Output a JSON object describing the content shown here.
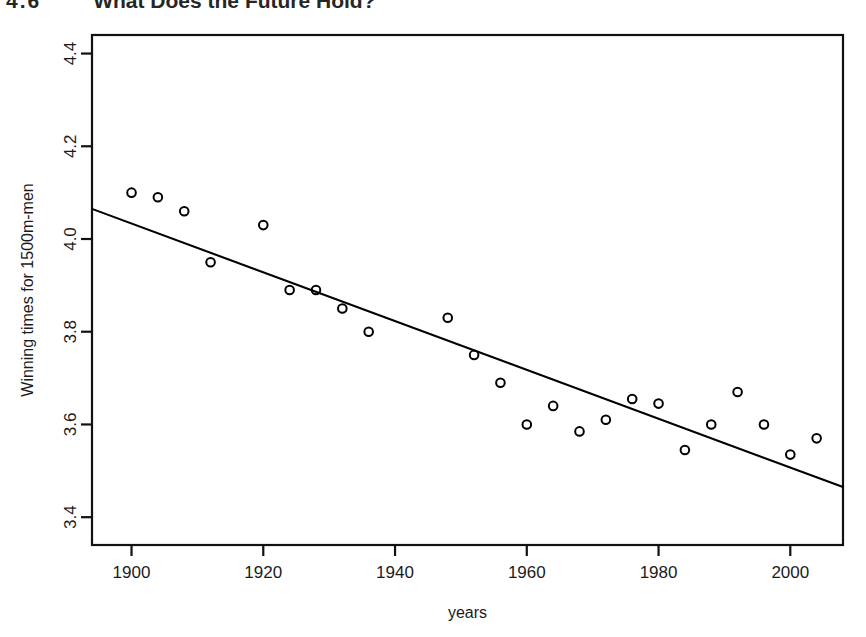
{
  "slide": {
    "number": "4.6",
    "title": "What Does the Future Hold?"
  },
  "chart_data": {
    "type": "scatter",
    "title": "",
    "xlabel": "years",
    "ylabel": "Winning times for 1500m-men",
    "xlim": [
      1894,
      2008
    ],
    "ylim": [
      3.34,
      4.44
    ],
    "xticks": [
      1900,
      1920,
      1940,
      1960,
      1980,
      2000
    ],
    "xtick_labels": [
      "1900",
      "1920",
      "1940",
      "1960",
      "1980",
      "2000"
    ],
    "yticks": [
      3.4,
      3.6,
      3.8,
      4.0,
      4.2,
      4.4
    ],
    "ytick_labels": [
      "3.4",
      "3.6",
      "3.8",
      "4.0",
      "4.2",
      "4.4"
    ],
    "grid": false,
    "legend": null,
    "marker": "open-circle",
    "marker_color": "#000000",
    "line_color": "#000000",
    "x": [
      1900,
      1904,
      1908,
      1912,
      1920,
      1924,
      1928,
      1932,
      1936,
      1948,
      1952,
      1956,
      1960,
      1964,
      1968,
      1972,
      1976,
      1980,
      1984,
      1988,
      1992,
      1996,
      2000,
      2004
    ],
    "y": [
      4.1,
      4.09,
      4.06,
      3.95,
      4.03,
      3.89,
      3.89,
      3.85,
      3.8,
      3.83,
      3.75,
      3.69,
      3.6,
      3.64,
      3.585,
      3.61,
      3.655,
      3.645,
      3.545,
      3.6,
      3.67,
      3.6,
      3.535,
      3.57
    ],
    "series": [
      {
        "name": "Winning times",
        "type": "scatter",
        "x": [
          1900,
          1904,
          1908,
          1912,
          1920,
          1924,
          1928,
          1932,
          1936,
          1948,
          1952,
          1956,
          1960,
          1964,
          1968,
          1972,
          1976,
          1980,
          1984,
          1988,
          1992,
          1996,
          2000,
          2004
        ],
        "values": [
          4.1,
          4.09,
          4.06,
          3.95,
          4.03,
          3.89,
          3.89,
          3.85,
          3.8,
          3.83,
          3.75,
          3.69,
          3.6,
          3.64,
          3.585,
          3.61,
          3.655,
          3.645,
          3.545,
          3.6,
          3.67,
          3.6,
          3.535,
          3.57
        ]
      },
      {
        "name": "Regression line",
        "type": "line",
        "x": [
          1894,
          2008
        ],
        "values": [
          4.065,
          3.465
        ]
      }
    ]
  }
}
